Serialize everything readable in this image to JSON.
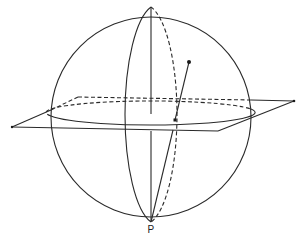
{
  "figure": {
    "labels": {
      "pole": "P"
    },
    "colors": {
      "stroke": "#2a2a2a",
      "background": "#ffffff"
    },
    "elements": [
      "sphere-outline",
      "equator-front",
      "equator-back-dashed",
      "meridian-front",
      "meridian-back-dashed",
      "plane-front-edges",
      "plane-back-edges-dashed",
      "vertical-axis",
      "point-on-sphere",
      "projected-point",
      "projection-line"
    ]
  }
}
